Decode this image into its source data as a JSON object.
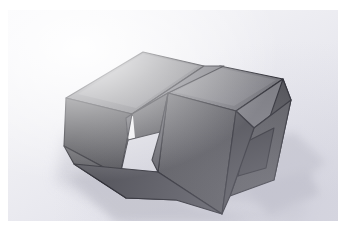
{
  "scene": {
    "kind": "photograph",
    "subject": "interlocking-3d-blocks",
    "description": "Photograph of a CAD-rendered pair of interlocking C-shaped rectangular blocks resting on a pale surface, lit from upper left with soft cast shadows to the lower right.",
    "orientation": "isometric-view",
    "surface": "matte light gray backdrop",
    "caption": "",
    "labels": [],
    "colors": {
      "page_background": "#ffffff",
      "plate_background_light": "#f7f7fa",
      "plate_background_dark": "#dedee6",
      "top_face": "#6f6f74",
      "top_face_light": "#7b7b81",
      "left_face": "#4b4b50",
      "front_face": "#555559",
      "inner_face": "#5e5e63",
      "inner_face_dark": "#3f3f44",
      "recess_face": "#4a4a4f",
      "edge_line": "#23232a",
      "highlight_sliver": "#f2f2f4",
      "shadow": "#c6c6ce",
      "shadow_soft": "#d6d6de"
    },
    "geometry": {
      "leftmost_vertex": "58,88",
      "rightmost_vertex": "283,90",
      "topmost_vertex": "135,42",
      "bottommost_vertex": "214,204",
      "aperture": "open rectangular window through the left block",
      "recess": "square notch in the right block front face"
    },
    "lighting": {
      "key_direction": "upper-left",
      "shadow_direction": "lower-right",
      "shadow_softness": "soft"
    }
  }
}
